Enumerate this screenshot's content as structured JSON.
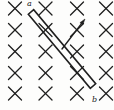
{
  "figure": {
    "background_color": "#fdfdfc",
    "ink_color": "#1f1f1f",
    "width": 114,
    "height": 110
  },
  "labels": {
    "rod_end_top": "a",
    "rod_end_bottom": "b"
  },
  "field": {
    "symbol": "×",
    "meaning": "magnetic-field-into-page",
    "rows": 5,
    "cols": 4,
    "mark_half_size": 6.5,
    "stroke_width": 1.3,
    "x_positions": [
      15,
      45.5,
      77,
      106
    ],
    "y_positions": [
      8.5,
      30,
      51.5,
      73,
      93.5
    ]
  },
  "rod": {
    "name": "conducting-rod",
    "x1": 31,
    "y1": 12,
    "x2": 93,
    "y2": 86,
    "thickness": 7,
    "stroke_width": 1.6
  },
  "velocity_arrow": {
    "name": "velocity-arrow",
    "x1": 62,
    "y1": 49,
    "x2": 85,
    "y2": 19,
    "stroke_width": 1.4,
    "head_length": 6,
    "head_width": 3.6
  }
}
